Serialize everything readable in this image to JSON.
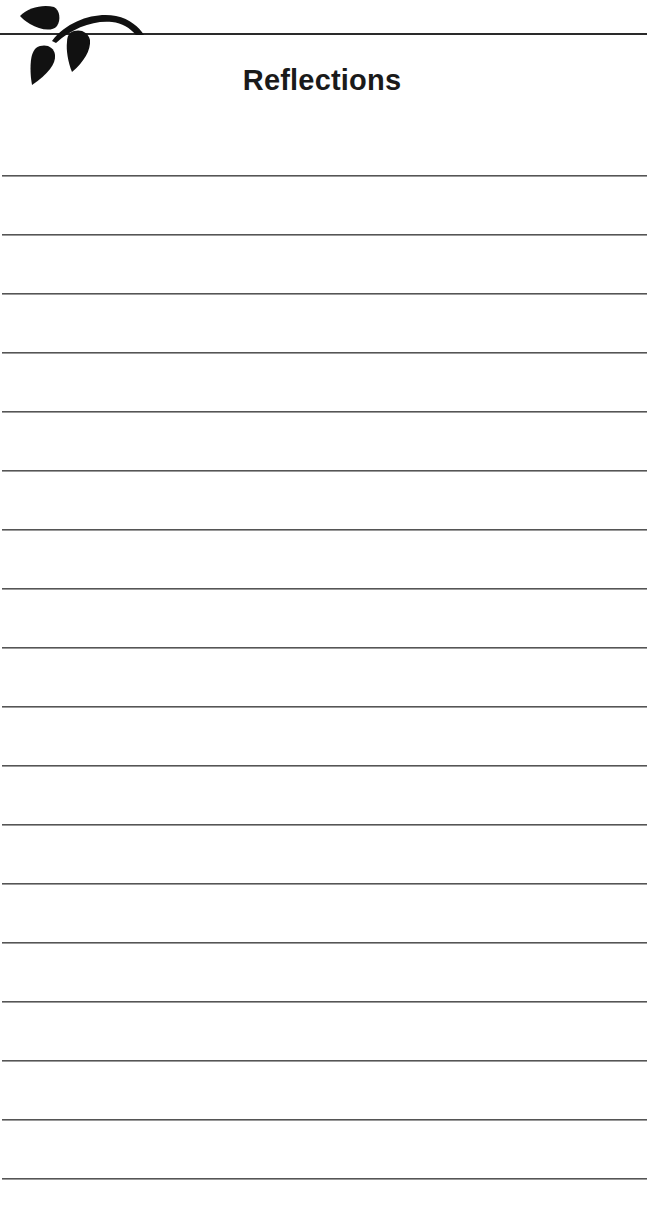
{
  "page": {
    "title": "Reflections",
    "logo_icon": "leaf-branch-icon",
    "line_count": 18,
    "first_line_y": 175,
    "line_spacing": 59.0,
    "ink_color": "#1a1a1a",
    "rule_color": "#555555"
  }
}
